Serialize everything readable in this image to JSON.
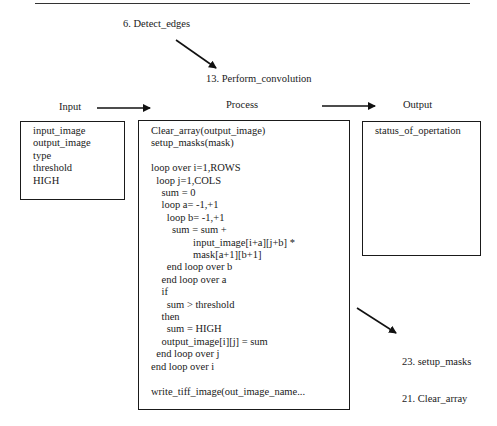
{
  "diagram": {
    "parent_module": "6. Detect_edges",
    "module_title": "13. Perform_convolution",
    "columns": {
      "input": "Input",
      "process": "Process",
      "output": "Output"
    },
    "input_box": {
      "items": [
        "input_image",
        "output_image",
        "type",
        "threshold",
        "HIGH"
      ]
    },
    "process_box": {
      "lines": [
        "Clear_array(output_image)",
        "setup_masks(mask)",
        "",
        "loop over i=1,ROWS",
        "  loop j=1,COLS",
        "    sum = 0",
        "    loop a= -1,+1",
        "      loop b= -1,+1",
        "        sum = sum +",
        "                input_image[i+a][j+b] *",
        "                mask[a+1][b+1]",
        "      end loop over b",
        "    end loop over a",
        "    if",
        "      sum > threshold",
        "    then",
        "      sum = HIGH",
        "    output_image[i][j] = sum",
        "  end loop over j",
        "end loop over i",
        "",
        "write_tiff_image(out_image_name..."
      ]
    },
    "output_box": {
      "items": [
        "status_of_opertation"
      ]
    },
    "submodules": [
      "23. setup_masks",
      "21. Clear_array"
    ]
  }
}
